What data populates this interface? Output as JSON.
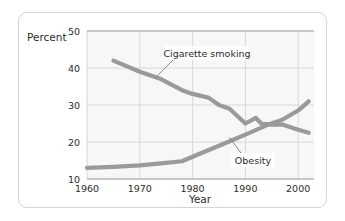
{
  "chart_data": {
    "type": "line",
    "title": "",
    "xlabel": "Year",
    "ylabel": "Percent",
    "xlim": [
      1960,
      2003
    ],
    "ylim": [
      10,
      50
    ],
    "xticks": [
      "1960",
      "1970",
      "1980",
      "1990",
      "2000"
    ],
    "xtick_values": [
      1960,
      1970,
      1980,
      1990,
      2000
    ],
    "yticks": [
      "10",
      "20",
      "30",
      "40",
      "50"
    ],
    "ytick_values": [
      10,
      20,
      30,
      40,
      50
    ],
    "grid": true,
    "legend_position": "inline-annotations",
    "line_color": "#9a9a9a",
    "grid_color": "#d8d8d8",
    "plot_background": "#f7f7f7",
    "series": [
      {
        "name": "Cigarette smoking",
        "label": "Cigarette smoking",
        "x": [
          1965,
          1970,
          1974,
          1978,
          1980,
          1983,
          1985,
          1987,
          1990,
          1992,
          1993,
          1995,
          1997,
          2000,
          2002
        ],
        "values": [
          42.0,
          39.0,
          37.0,
          34.0,
          33.0,
          32.0,
          30.0,
          29.0,
          25.0,
          26.5,
          25.0,
          24.7,
          24.7,
          23.3,
          22.5
        ]
      },
      {
        "name": "Obesity",
        "label": "Obesity",
        "x": [
          1960,
          1965,
          1970,
          1974,
          1978,
          1980,
          1985,
          1990,
          1994,
          1997,
          2000,
          2002
        ],
        "values": [
          13.0,
          13.3,
          13.7,
          14.2,
          14.8,
          16.0,
          19.0,
          22.0,
          24.5,
          26.0,
          28.5,
          31.0
        ]
      }
    ],
    "annotations": [
      {
        "text": "Cigarette smoking",
        "target_x": 1973,
        "target_y": 37.4
      },
      {
        "text": "Obesity",
        "target_x": 1987,
        "target_y": 21.2
      }
    ]
  }
}
